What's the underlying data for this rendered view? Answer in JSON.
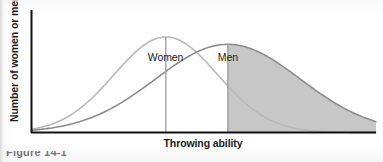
{
  "figure": {
    "caption_partial": "Figure 14-1"
  },
  "chart_data": {
    "type": "line",
    "title": "",
    "subtitle": "",
    "xlabel": "Throwing ability",
    "ylabel": "Number of women or men",
    "grid": false,
    "legend_position": "inline-annotations",
    "xlim": [
      0,
      100
    ],
    "ylim": [
      0,
      100
    ],
    "axis_ticks": {
      "x": [],
      "y": []
    },
    "series": [
      {
        "name": "Women",
        "color": "#b9b9b9",
        "distribution": "normal",
        "mean": 39,
        "std_dev": 15,
        "peak_height": 78,
        "mean_line": true,
        "shaded": false,
        "label": "Women"
      },
      {
        "name": "Men",
        "color": "#8c8c8c",
        "distribution": "normal",
        "mean": 57,
        "std_dev": 21,
        "peak_height": 72,
        "mean_line": true,
        "shaded": true,
        "shade_from": 57,
        "shade_to": 100,
        "shade_color": "#c4c4c4",
        "label": "Men"
      }
    ],
    "annotations": [
      {
        "text": "Women",
        "x": 39,
        "y": 90
      },
      {
        "text": "Men",
        "x": 57,
        "y": 90
      }
    ],
    "colors": {
      "axis": "#111111",
      "women_curve": "#b9b9b9",
      "men_curve": "#8c8c8c",
      "shaded_area": "#c4c4c4",
      "mean_line": "#9a9a9a",
      "text": "#1b1b1b",
      "background": "#fdfdfd"
    }
  }
}
